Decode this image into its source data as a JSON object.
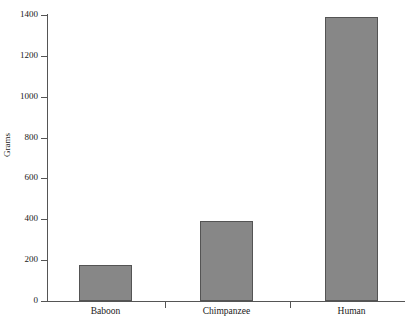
{
  "chart_data": {
    "type": "bar",
    "title": "",
    "subtitle": "",
    "categories": [
      "Baboon",
      "Chimpanzee",
      "Human"
    ],
    "values": [
      175,
      393,
      1390
    ],
    "series": [
      {
        "name": "Brain mass",
        "values": [
          175,
          393,
          1390
        ]
      }
    ],
    "xlabel": "",
    "ylabel": "Grams",
    "ylim": [
      0,
      1400
    ],
    "yticks": [
      0,
      200,
      400,
      600,
      800,
      1000,
      1200,
      1400
    ],
    "ytick_labels": [
      "0",
      "200",
      "400",
      "600",
      "800",
      "1000",
      "1200",
      "1400"
    ],
    "grid": false,
    "legend": false,
    "bar_color": "#878787",
    "bar_edge_color": "#545454",
    "axis_color": "#555555",
    "background_color": "#ffffff",
    "text_color": "#1a1a1a"
  }
}
